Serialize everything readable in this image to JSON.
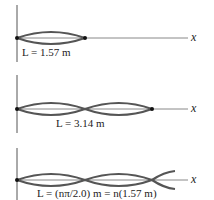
{
  "panels": [
    {
      "label": "L = 1.57 m",
      "axis": "x",
      "loops": 1
    },
    {
      "label": "L = 3.14 m",
      "axis": "x",
      "loops": 2
    },
    {
      "label": "L = (nπ/2.0) m = n(1.57 m)",
      "axis": "x",
      "loops": "n"
    }
  ],
  "colors": {
    "wave": "#555555",
    "axis": "#888888",
    "node": "#111111"
  }
}
